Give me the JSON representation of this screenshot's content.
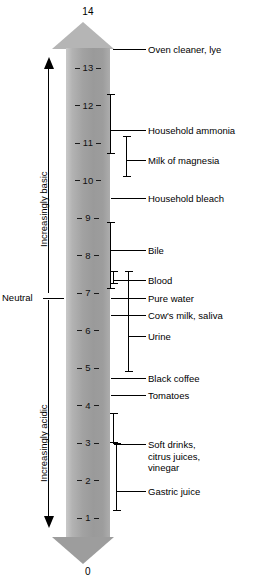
{
  "diagram": {
    "axis": {
      "top_value": "14",
      "bottom_value": "0",
      "ticks": [
        {
          "label": "13",
          "value": 13
        },
        {
          "label": "12",
          "value": 12
        },
        {
          "label": "11",
          "value": 11
        },
        {
          "label": "10",
          "value": 10
        },
        {
          "label": "9",
          "value": 9
        },
        {
          "label": "8",
          "value": 8
        },
        {
          "label": "7",
          "value": 7
        },
        {
          "label": "6",
          "value": 6
        },
        {
          "label": "5",
          "value": 5
        },
        {
          "label": "4",
          "value": 4
        },
        {
          "label": "3",
          "value": 3
        },
        {
          "label": "2",
          "value": 2
        },
        {
          "label": "1",
          "value": 1
        }
      ]
    },
    "direction_captions": {
      "basic": "Increasingly basic",
      "acidic": "Increasingly acidic"
    },
    "neutral_marker": {
      "label": "Neutral",
      "value": 7
    },
    "substances": [
      {
        "label": "Oven cleaner, lye",
        "kind": "line",
        "value": 13.5
      },
      {
        "label": "Household ammonia",
        "kind": "range",
        "from": 10.7,
        "to": 12.3
      },
      {
        "label": "Milk of magnesia",
        "kind": "range",
        "from": 10.1,
        "to": 11.2
      },
      {
        "label": "Household bleach",
        "kind": "line",
        "value": 9.5
      },
      {
        "label": "Bile",
        "kind": "range",
        "from": 7.1,
        "to": 8.9
      },
      {
        "label": "Blood",
        "kind": "range",
        "from": 7.25,
        "to": 7.6
      },
      {
        "label": "Pure water",
        "kind": "line",
        "value": 7.0
      },
      {
        "label": "Cow's milk, saliva",
        "kind": "line",
        "value": 6.7
      },
      {
        "label": "Urine",
        "kind": "range",
        "from": 4.9,
        "to": 7.6
      },
      {
        "label": "Black coffee",
        "kind": "line",
        "value": 5.0
      },
      {
        "label": "Tomatoes",
        "kind": "line",
        "value": 4.6
      },
      {
        "label": "Soft drinks,\ncitrus juices,\nvinegar",
        "kind": "range",
        "from": 3.0,
        "to": 3.8
      },
      {
        "label": "Gastric juice",
        "kind": "range",
        "from": 1.2,
        "to": 3.0
      }
    ],
    "colors": {
      "bar_light": "#c9c9c9",
      "bar_dark": "#9a9a9a",
      "ink": "#000000",
      "background": "#ffffff"
    }
  }
}
